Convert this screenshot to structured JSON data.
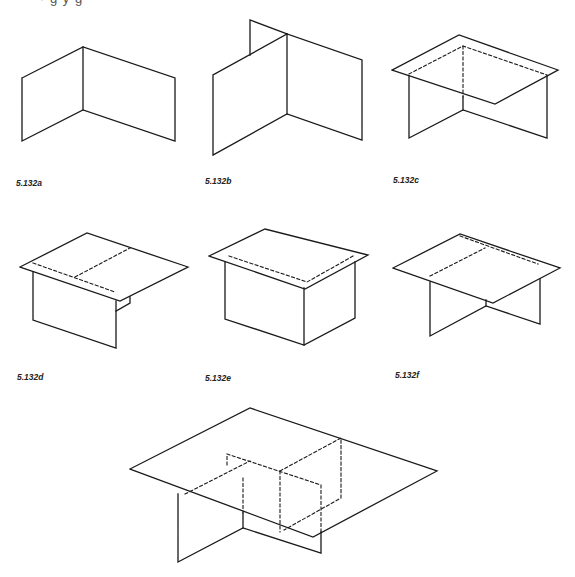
{
  "page": {
    "top_clipped_text": "·  g    y     g",
    "stroke_color": "#1a1a1a",
    "background": "#ffffff"
  },
  "figures": [
    {
      "id": "a",
      "label": "5.132a",
      "label_pos": [
        16,
        178
      ],
      "solid": [
        [
          [
            22,
            78
          ],
          [
            83,
            47
          ],
          [
            175,
            78
          ],
          [
            175,
            141
          ],
          [
            83,
            110
          ],
          [
            22,
            141
          ],
          [
            22,
            78
          ]
        ],
        [
          [
            83,
            47
          ],
          [
            83,
            110
          ]
        ]
      ],
      "dashed": []
    },
    {
      "id": "b",
      "label": "5.132b",
      "label_pos": [
        205,
        176
      ],
      "solid": [
        [
          [
            250,
            55
          ],
          [
            250,
            20
          ],
          [
            287,
            34
          ]
        ],
        [
          [
            213,
            155
          ],
          [
            213,
            75
          ],
          [
            287,
            34
          ],
          [
            362,
            60
          ],
          [
            362,
            140
          ],
          [
            287,
            114
          ],
          [
            213,
            155
          ]
        ],
        [
          [
            287,
            34
          ],
          [
            287,
            114
          ]
        ]
      ],
      "dashed": []
    },
    {
      "id": "c",
      "label": "5.132c",
      "label_pos": [
        393,
        175
      ],
      "solid": [
        [
          [
            392,
            70
          ],
          [
            459,
            35
          ],
          [
            558,
            70
          ],
          [
            495,
            104
          ],
          [
            392,
            70
          ]
        ],
        [
          [
            409,
            76
          ],
          [
            409,
            138
          ],
          [
            463,
            110
          ],
          [
            547,
            138
          ],
          [
            547,
            76
          ]
        ],
        [
          [
            463,
            97
          ],
          [
            463,
            110
          ]
        ]
      ],
      "dashed": [
        [
          [
            409,
            74
          ],
          [
            463,
            46
          ],
          [
            547,
            75
          ]
        ],
        [
          [
            463,
            46
          ],
          [
            463,
            97
          ]
        ]
      ]
    },
    {
      "id": "d",
      "label": "5.132d",
      "label_pos": [
        17,
        372
      ],
      "solid": [
        [
          [
            20,
            267
          ],
          [
            87,
            233
          ],
          [
            188,
            267
          ],
          [
            120,
            301
          ],
          [
            20,
            267
          ]
        ],
        [
          [
            33,
            272
          ],
          [
            33,
            320
          ],
          [
            116,
            348
          ],
          [
            116,
            301
          ]
        ],
        [
          [
            116,
            311
          ],
          [
            130,
            303
          ],
          [
            130,
            297
          ]
        ]
      ],
      "dashed": [
        [
          [
            33,
            263
          ],
          [
            115,
            292
          ]
        ],
        [
          [
            75,
            277
          ],
          [
            130,
            248
          ]
        ]
      ]
    },
    {
      "id": "e",
      "label": "5.132e",
      "label_pos": [
        205,
        373
      ],
      "solid": [
        [
          [
            209,
            256
          ],
          [
            265,
            229
          ],
          [
            368,
            255
          ],
          [
            305,
            289
          ],
          [
            209,
            256
          ]
        ],
        [
          [
            225,
            262
          ],
          [
            225,
            319
          ],
          [
            304,
            345
          ],
          [
            355,
            318
          ],
          [
            355,
            262
          ]
        ],
        [
          [
            304,
            288
          ],
          [
            304,
            345
          ]
        ]
      ],
      "dashed": [
        [
          [
            229,
            256
          ],
          [
            307,
            282
          ],
          [
            355,
            255
          ]
        ]
      ]
    },
    {
      "id": "f",
      "label": "5.132f",
      "label_pos": [
        395,
        370
      ],
      "solid": [
        [
          [
            393,
            268
          ],
          [
            460,
            234
          ],
          [
            560,
            268
          ],
          [
            493,
            303
          ],
          [
            393,
            268
          ]
        ],
        [
          [
            430,
            282
          ],
          [
            430,
            336
          ],
          [
            486,
            306
          ],
          [
            540,
            324
          ],
          [
            540,
            279
          ]
        ],
        [
          [
            486,
            300
          ],
          [
            486,
            306
          ]
        ]
      ],
      "dashed": [
        [
          [
            460,
            236
          ],
          [
            538,
            264
          ]
        ],
        [
          [
            430,
            276
          ],
          [
            485,
            248
          ]
        ]
      ]
    },
    {
      "id": "g",
      "label": "",
      "label_pos": [
        0,
        0
      ],
      "solid": [
        [
          [
            130,
            469
          ],
          [
            250,
            408
          ],
          [
            437,
            471
          ],
          [
            313,
            537
          ],
          [
            130,
            469
          ]
        ],
        [
          [
            178,
            494
          ],
          [
            178,
            562
          ],
          [
            243,
            528
          ],
          [
            321,
            553
          ],
          [
            321,
            532
          ]
        ],
        [
          [
            243,
            513
          ],
          [
            243,
            528
          ]
        ]
      ],
      "dashed": [
        [
          [
            185,
            494
          ],
          [
            250,
            461
          ]
        ],
        [
          [
            227,
            465
          ],
          [
            227,
            454
          ],
          [
            321,
            485
          ],
          [
            321,
            532
          ]
        ],
        [
          [
            243,
            478
          ],
          [
            243,
            513
          ]
        ],
        [
          [
            280,
            471
          ],
          [
            341,
            438
          ],
          [
            341,
            498
          ],
          [
            284,
            530
          ]
        ],
        [
          [
            280,
            471
          ],
          [
            280,
            532
          ]
        ]
      ]
    }
  ]
}
